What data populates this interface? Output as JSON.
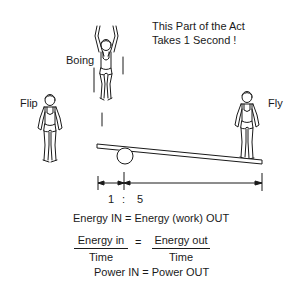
{
  "caption": {
    "line1": "This Part of the Act",
    "line2": "Takes 1 Second !"
  },
  "figures": {
    "boing": "Boing",
    "flip": "Flip",
    "fly": "Fly"
  },
  "ratio": {
    "left": "1",
    "separator": ":",
    "right": "5"
  },
  "equations": {
    "energy": "Energy IN = Energy (work) OUT",
    "fraction_left_num": "Energy in",
    "fraction_left_den": "Time",
    "equals": "=",
    "fraction_right_num": "Energy out",
    "fraction_right_den": "Time",
    "power": "Power IN = Power  OUT"
  },
  "colors": {
    "ink": "#1a1a1a",
    "background": "#ffffff"
  }
}
